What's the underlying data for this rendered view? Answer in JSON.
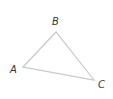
{
  "diagram": {
    "type": "triangle",
    "vertices": [
      {
        "label": "A",
        "x": 23,
        "y": 67
      },
      {
        "label": "B",
        "x": 56,
        "y": 32
      },
      {
        "label": "C",
        "x": 94,
        "y": 80
      }
    ],
    "labels": {
      "a": "A",
      "b": "B",
      "c": "C"
    },
    "stroke_color": "#c8c8c8",
    "label_color": "#333333"
  }
}
